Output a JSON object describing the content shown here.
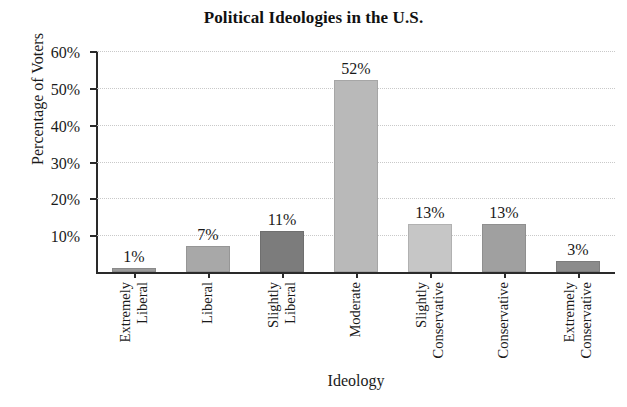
{
  "chart_data": {
    "type": "bar",
    "title": "Political Ideologies in the U.S.",
    "xlabel": "Ideology",
    "ylabel": "Percentage of Voters",
    "categories": [
      "Extremely Liberal",
      "Liberal",
      "Slightly Liberal",
      "Moderate",
      "Slightly Conservative",
      "Conservative",
      "Extremely Conservative"
    ],
    "category_lines": [
      [
        "Extremely",
        "Liberal"
      ],
      [
        "Liberal"
      ],
      [
        "Slightly",
        "Liberal"
      ],
      [
        "Moderate"
      ],
      [
        "Slightly",
        "Conservative"
      ],
      [
        "Conservative"
      ],
      [
        "Extremely",
        "Conservative"
      ]
    ],
    "values": [
      1,
      7,
      11,
      52,
      13,
      13,
      3
    ],
    "value_labels": [
      "1%",
      "7%",
      "11%",
      "52%",
      "13%",
      "13%",
      "3%"
    ],
    "bar_colors": [
      "#9a9a9a",
      "#a8a8a8",
      "#7c7c7c",
      "#b9b9b9",
      "#c6c6c6",
      "#a0a0a0",
      "#8b8b8b"
    ],
    "ylim": [
      0,
      60
    ],
    "ytick_values": [
      10,
      20,
      30,
      40,
      50,
      60
    ],
    "ytick_labels": [
      "10%",
      "20%",
      "30%",
      "40%",
      "50%",
      "60%"
    ],
    "grid": true,
    "grid_color": "#c9c9c9",
    "axis_color": "#2a2a2a",
    "legend": "none",
    "background": "#ffffff"
  }
}
